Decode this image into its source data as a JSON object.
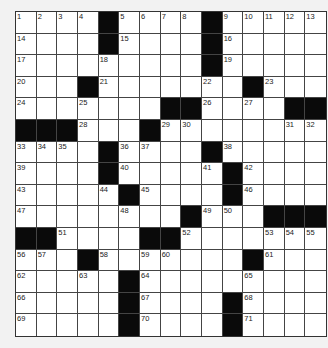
{
  "puzzle": {
    "rows": 15,
    "cols": 15,
    "colors": {
      "background": "#f2f2f2",
      "cell": "#ffffff",
      "block": "#0a0a0a",
      "grid_line": "#444444",
      "number": "#222222"
    },
    "legend": "Each row string: '#' = black square, '.' = empty white square, number = clue number in white square",
    "grid": [
      [
        "1",
        "2",
        "3",
        "4",
        "#",
        "5",
        "6",
        "7",
        "8",
        "#",
        "9",
        "10",
        "11",
        "12",
        "13"
      ],
      [
        "14",
        ".",
        ".",
        ".",
        "#",
        "15",
        ".",
        ".",
        ".",
        "#",
        "16",
        ".",
        ".",
        ".",
        "."
      ],
      [
        "17",
        ".",
        ".",
        ".",
        "18",
        ".",
        ".",
        ".",
        ".",
        "#",
        "19",
        ".",
        ".",
        ".",
        "."
      ],
      [
        "20",
        ".",
        ".",
        "#",
        "21",
        ".",
        ".",
        ".",
        ".",
        "22",
        ".",
        "#",
        "23",
        ".",
        "."
      ],
      [
        "24",
        ".",
        ".",
        "25",
        ".",
        ".",
        ".",
        "#",
        "#",
        "26",
        ".",
        "27",
        ".",
        "#",
        "#"
      ],
      [
        "#",
        "#",
        "#",
        "28",
        ".",
        ".",
        "#",
        "29",
        "30",
        ".",
        ".",
        ".",
        ".",
        "31",
        "32"
      ],
      [
        "33",
        "34",
        "35",
        ".",
        "#",
        "36",
        "37",
        ".",
        ".",
        "#",
        "38",
        ".",
        ".",
        ".",
        "."
      ],
      [
        "39",
        ".",
        ".",
        ".",
        "#",
        "40",
        ".",
        ".",
        ".",
        "41",
        "#",
        "42",
        ".",
        ".",
        "."
      ],
      [
        "43",
        ".",
        ".",
        ".",
        "44",
        "#",
        "45",
        ".",
        ".",
        ".",
        "#",
        "46",
        ".",
        ".",
        "."
      ],
      [
        "47",
        ".",
        ".",
        ".",
        ".",
        "48",
        ".",
        ".",
        "#",
        "49",
        "50",
        ".",
        "#",
        "#",
        "#"
      ],
      [
        "#",
        "#",
        "51",
        ".",
        ".",
        ".",
        "#",
        "#",
        "52",
        ".",
        ".",
        ".",
        "53",
        "54",
        "55"
      ],
      [
        "56",
        "57",
        ".",
        "#",
        "58",
        ".",
        "59",
        "60",
        ".",
        ".",
        ".",
        "#",
        "61",
        ".",
        "."
      ],
      [
        "62",
        ".",
        ".",
        "63",
        ".",
        "#",
        "64",
        ".",
        ".",
        ".",
        ".",
        "65",
        ".",
        ".",
        "."
      ],
      [
        "66",
        ".",
        ".",
        ".",
        ".",
        "#",
        "67",
        ".",
        ".",
        ".",
        "#",
        "68",
        ".",
        ".",
        "."
      ],
      [
        "69",
        ".",
        ".",
        ".",
        ".",
        "#",
        "70",
        ".",
        ".",
        ".",
        "#",
        "71",
        ".",
        ".",
        "."
      ]
    ]
  }
}
